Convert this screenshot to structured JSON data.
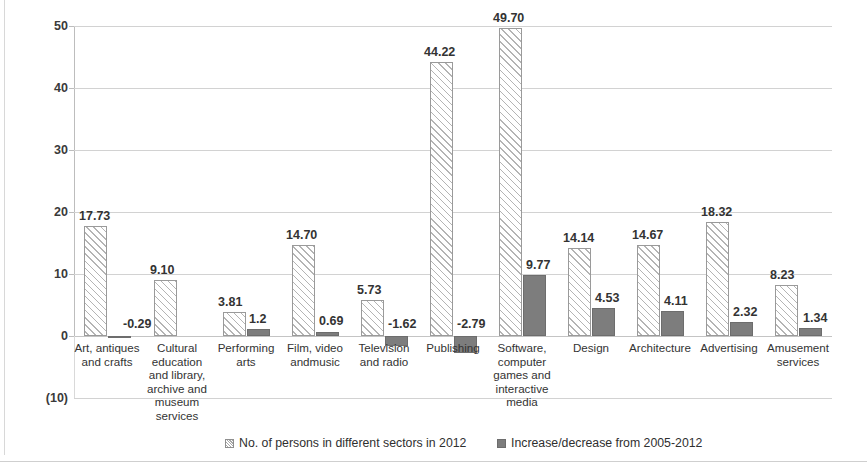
{
  "chart_data": {
    "type": "bar",
    "title": "",
    "subtitle": "",
    "xlabel": "",
    "ylabel": "",
    "ylim": [
      -10,
      50
    ],
    "yticks": [
      50,
      40,
      30,
      20,
      10,
      0,
      -10
    ],
    "ytick_labels": [
      "50",
      "40",
      "30",
      "20",
      "10",
      "0",
      "(10)"
    ],
    "grid": true,
    "legend_position": "bottom",
    "categories": [
      "Art, antiques and crafts",
      "Cultural education and library, archive and museum services",
      "Performing arts",
      "Film, video andmusic",
      "Television and radio",
      "Publishing",
      "Software, computer games and interactive media",
      "Design",
      "Architecture",
      "Advertising",
      "Amusement services"
    ],
    "category_lines": [
      [
        "Art, antiques",
        "and crafts"
      ],
      [
        "Cultural",
        "education",
        "and library,",
        "archive and",
        "museum",
        "services"
      ],
      [
        "Performing",
        "arts"
      ],
      [
        "Film, video",
        "andmusic"
      ],
      [
        "Television",
        "and radio"
      ],
      [
        "Publishing"
      ],
      [
        "Software,",
        "computer",
        "games and",
        "interactive",
        "media"
      ],
      [
        "Design"
      ],
      [
        "Architecture"
      ],
      [
        "Advertising"
      ],
      [
        "Amusement",
        "services"
      ]
    ],
    "series": [
      {
        "name": "No. of persons in different sectors in 2012",
        "style": "hatched",
        "color": "#fbfbfb",
        "values": [
          17.73,
          9.1,
          3.81,
          14.7,
          5.73,
          44.22,
          49.7,
          14.14,
          14.67,
          18.32,
          8.23
        ],
        "labels": [
          "17.73",
          "9.10",
          "3.81",
          "14.70",
          "5.73",
          "44.22",
          "49.70",
          "14.14",
          "14.67",
          "18.32",
          "8.23"
        ]
      },
      {
        "name": "Increase/decrease from 2005-2012",
        "style": "solid",
        "color": "#7d7d7d",
        "values": [
          -0.29,
          null,
          1.2,
          0.69,
          -1.62,
          -2.79,
          9.77,
          4.53,
          4.11,
          2.32,
          1.34
        ],
        "labels": [
          "-0.29",
          "",
          "1.2",
          "0.69",
          "-1.62",
          "-2.79",
          "9.77",
          "4.53",
          "4.11",
          "2.32",
          "1.34"
        ]
      }
    ]
  },
  "legend": {
    "items": [
      {
        "label": "No. of persons in different sectors in 2012",
        "swatch": "hatched"
      },
      {
        "label": "Increase/decrease from 2005-2012",
        "swatch": "solid"
      }
    ]
  }
}
